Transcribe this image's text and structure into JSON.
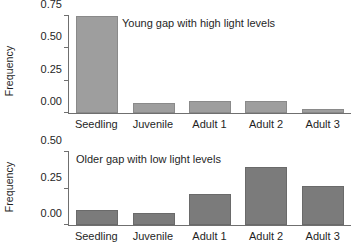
{
  "chart_data": [
    {
      "type": "bar",
      "title": "Young gap with high light levels",
      "xlabel": "",
      "ylabel": "Frequency",
      "categories": [
        "Seedling",
        "Juvenile",
        "Adult 1",
        "Adult 2",
        "Adult 3"
      ],
      "values": [
        0.75,
        0.08,
        0.09,
        0.09,
        0.03
      ],
      "yticks": [
        "0.00",
        "0.25",
        "0.50",
        "0.75"
      ],
      "ytick_values": [
        0.0,
        0.25,
        0.5,
        0.75
      ],
      "ylim": [
        0,
        0.75
      ],
      "grid": false,
      "legend": "none",
      "bar_color": "#9e9e9e"
    },
    {
      "type": "bar",
      "title": "Older gap with low light levels",
      "xlabel": "",
      "ylabel": "Frequency",
      "categories": [
        "Seedling",
        "Juvenile",
        "Adult 1",
        "Adult 2",
        "Adult 3"
      ],
      "values": [
        0.1,
        0.08,
        0.21,
        0.4,
        0.27
      ],
      "yticks": [
        "0.00",
        "0.25",
        "0.50"
      ],
      "ytick_values": [
        0.0,
        0.25,
        0.5
      ],
      "ylim": [
        0,
        0.5
      ],
      "grid": false,
      "legend": "none",
      "bar_color": "#7b7b7b"
    }
  ]
}
